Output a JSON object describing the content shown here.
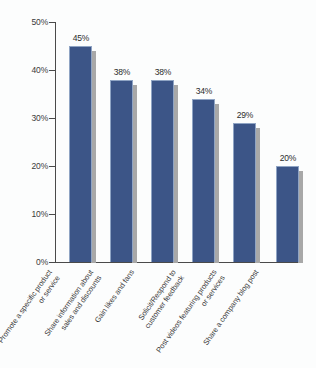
{
  "chart_data": {
    "type": "bar",
    "title": "",
    "subtitle": "",
    "xlabel": "",
    "ylabel": "",
    "ylim": [
      0,
      50
    ],
    "yunit": "%",
    "grid": false,
    "legend": "none",
    "orientation": "vertical",
    "categories": [
      "Promote a specific product or service",
      "Share information about sales and discounts",
      "Gain likes and fans",
      "Solicit/Respond to customer feedback",
      "Post videos featuring products or services",
      "Share a company blog post"
    ],
    "category_lines": [
      [
        "Promote a specific product",
        "or service"
      ],
      [
        "Share information about",
        "sales and discounts"
      ],
      [
        "Gain likes and fans"
      ],
      [
        "Solicit/Respond to",
        "customer feedback"
      ],
      [
        "Post videos featuring products",
        "or services"
      ],
      [
        "Share a company blog post"
      ]
    ],
    "values": [
      45,
      38,
      38,
      34,
      29,
      20
    ],
    "data_labels": [
      "45%",
      "38%",
      "38%",
      "34%",
      "29%",
      "20%"
    ],
    "ytick_values": [
      0,
      10,
      20,
      30,
      40,
      50
    ],
    "ytick_labels": [
      "0%",
      "10%",
      "20%",
      "30%",
      "40%",
      "50%"
    ],
    "colors": {
      "bar": "#3c5587",
      "bar_border": "#8fa4c4",
      "bar_shadow": "#a8a8a8",
      "axis": "#4a4a4a",
      "text": "#3a3a3a",
      "background": "#fcfdfd"
    }
  }
}
